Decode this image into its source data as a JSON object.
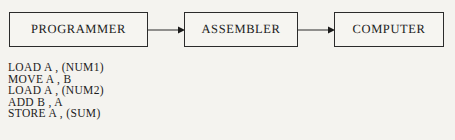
{
  "diagram": {
    "boxes": [
      {
        "label": "PROGRAMMER"
      },
      {
        "label": "ASSEMBLER"
      },
      {
        "label": "COMPUTER"
      }
    ],
    "arrows": [
      {
        "name": "programmer-to-assembler"
      },
      {
        "name": "assembler-to-computer"
      }
    ],
    "stroke_color": "#2b2b2b"
  },
  "code_listing": {
    "lines": [
      "LOAD A , (NUM1)",
      "MOVE A , B",
      "LOAD A , (NUM2)",
      "ADD B , A",
      "STORE A , (SUM)"
    ]
  },
  "page": {
    "background_color": "#f4f3ef",
    "text_color": "#1a1a1a"
  }
}
